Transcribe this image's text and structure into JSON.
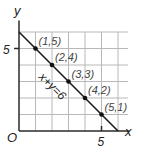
{
  "chart_data": {
    "type": "line",
    "title": "",
    "xlabel": "x",
    "ylabel": "y",
    "xlim": [
      0,
      7
    ],
    "ylim": [
      0,
      7
    ],
    "grid": true,
    "origin_label": "O",
    "x_ticks": [
      {
        "value": 5,
        "label": "5"
      }
    ],
    "y_ticks": [
      {
        "value": 5,
        "label": "5"
      }
    ],
    "line": {
      "equation": "x + y = 6",
      "from": [
        0,
        6
      ],
      "to": [
        6,
        0
      ]
    },
    "series": [
      {
        "name": "x + y = 6",
        "points": [
          {
            "x": 1,
            "y": 5,
            "label": "(1,5)"
          },
          {
            "x": 2,
            "y": 4,
            "label": "(2,4)"
          },
          {
            "x": 3,
            "y": 3,
            "label": "(3,3)"
          },
          {
            "x": 4,
            "y": 2,
            "label": "(4,2)"
          },
          {
            "x": 5,
            "y": 1,
            "label": "(5,1)"
          }
        ]
      }
    ],
    "annotations": [
      "x + y = 6"
    ]
  }
}
